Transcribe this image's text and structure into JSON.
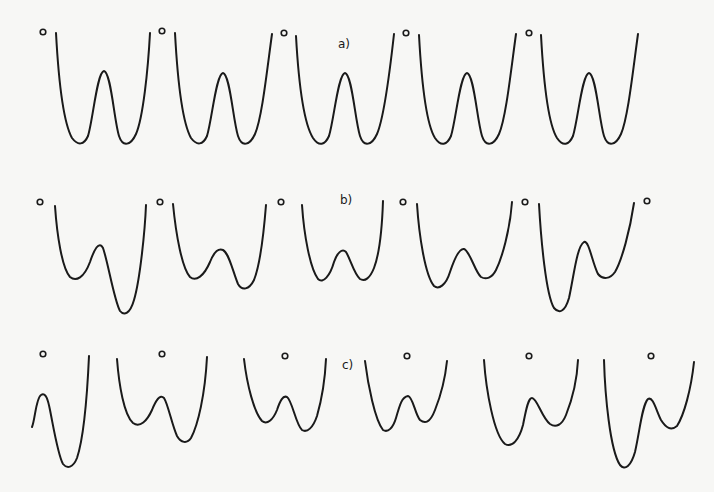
{
  "figure": {
    "panels": [
      {
        "label": "a)",
        "description": "symmetric double-well potentials",
        "curve_count": 5
      },
      {
        "label": "b)",
        "description": "asymmetric double-well potentials",
        "curve_count": 5
      },
      {
        "label": "c)",
        "description": "asymmetric double-well potentials with shifted barrier",
        "curve_count": 6
      }
    ],
    "marker_glyph": "o",
    "stroke_color": "#1a1a1a",
    "background_color": "#f7f7f5"
  }
}
